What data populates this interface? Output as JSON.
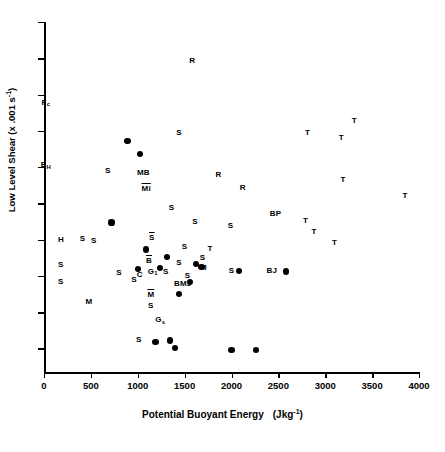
{
  "chart": {
    "type": "scatter",
    "title": "",
    "xlabel_main": "Potential Buoyant Energy",
    "xlabel_units": "(Jkg-1)",
    "ylabel": "Low Level Shear (x .001 s-1)"
  },
  "axes": {
    "x_ticks": [
      "0",
      "500",
      "1000",
      "1500",
      "2000",
      "2500",
      "3000",
      "3500",
      "4000"
    ],
    "x_tick_values": [
      0,
      500,
      1000,
      1500,
      2000,
      2500,
      3000,
      3500,
      4000
    ],
    "y_ticks": [
      "1",
      "2",
      "3",
      "4",
      "5",
      "6",
      "7",
      "8",
      "9",
      "10"
    ],
    "y_tick_values": [
      1,
      2,
      3,
      4,
      5,
      6,
      7,
      8,
      9,
      10
    ],
    "xlim": [
      0,
      4000
    ],
    "ylim": [
      0.35,
      10
    ],
    "grid": false,
    "legend": "none"
  },
  "chart_data": {
    "type": "scatter",
    "title": "",
    "xlabel": "Potential Buoyant Energy   (Jkg-1)",
    "ylabel": "Low Level Shear (x .001 s-1)",
    "xlim": [
      0,
      4000
    ],
    "ylim": [
      0.35,
      10
    ],
    "grid": false,
    "legend": "none",
    "marker_points": [
      {
        "x": 890,
        "y": 6.72
      },
      {
        "x": 1020,
        "y": 6.35
      },
      {
        "x": 720,
        "y": 4.47
      },
      {
        "x": 1090,
        "y": 3.73
      },
      {
        "x": 1310,
        "y": 3.53
      },
      {
        "x": 1240,
        "y": 3.22
      },
      {
        "x": 1620,
        "y": 3.33
      },
      {
        "x": 1680,
        "y": 3.25
      },
      {
        "x": 1560,
        "y": 2.83
      },
      {
        "x": 1440,
        "y": 2.5
      },
      {
        "x": 1000,
        "y": 3.18
      },
      {
        "x": 2080,
        "y": 3.13
      },
      {
        "x": 2580,
        "y": 3.12
      },
      {
        "x": 1190,
        "y": 1.18
      },
      {
        "x": 1400,
        "y": 1.02
      },
      {
        "x": 1340,
        "y": 1.22
      },
      {
        "x": 2000,
        "y": 0.96
      },
      {
        "x": 2260,
        "y": 0.96
      }
    ],
    "text_points": [
      {
        "label": "R",
        "x": 1580,
        "y": 8.93,
        "style": "plain"
      },
      {
        "label": "Fc",
        "x": 20,
        "y": 7.78,
        "style": "sub"
      },
      {
        "label": "T",
        "x": 3310,
        "y": 7.28,
        "style": "plain"
      },
      {
        "label": "T",
        "x": 2810,
        "y": 6.95,
        "style": "plain"
      },
      {
        "label": "T",
        "x": 3170,
        "y": 6.8,
        "style": "plain"
      },
      {
        "label": "S",
        "x": 1440,
        "y": 6.93,
        "style": "plain"
      },
      {
        "label": "EH",
        "x": 20,
        "y": 6.05,
        "style": "sub"
      },
      {
        "label": "S",
        "x": 680,
        "y": 5.9,
        "style": "plain"
      },
      {
        "label": "MB",
        "x": 1060,
        "y": 5.85,
        "style": "plain"
      },
      {
        "label": "R",
        "x": 1860,
        "y": 5.78,
        "style": "plain"
      },
      {
        "label": "T",
        "x": 3190,
        "y": 5.65,
        "style": "plain"
      },
      {
        "label": "Mi",
        "x": 1090,
        "y": 5.4,
        "style": "overline"
      },
      {
        "label": "R",
        "x": 2120,
        "y": 5.43,
        "style": "plain"
      },
      {
        "label": "T",
        "x": 3850,
        "y": 5.2,
        "style": "plain"
      },
      {
        "label": "S",
        "x": 1360,
        "y": 4.88,
        "style": "plain"
      },
      {
        "label": "BP",
        "x": 2470,
        "y": 4.72,
        "style": "plain"
      },
      {
        "label": "T",
        "x": 2790,
        "y": 4.5,
        "style": "plain"
      },
      {
        "label": "S",
        "x": 1610,
        "y": 4.48,
        "style": "plain"
      },
      {
        "label": "S",
        "x": 1990,
        "y": 4.38,
        "style": "plain"
      },
      {
        "label": "H",
        "x": 180,
        "y": 4.0,
        "style": "plain"
      },
      {
        "label": "S",
        "x": 410,
        "y": 4.03,
        "style": "plain"
      },
      {
        "label": "S",
        "x": 530,
        "y": 3.95,
        "style": "plain"
      },
      {
        "label": "S",
        "x": 1150,
        "y": 4.05,
        "style": "overline"
      },
      {
        "label": "S",
        "x": 1500,
        "y": 3.8,
        "style": "plain"
      },
      {
        "label": "T",
        "x": 1770,
        "y": 3.75,
        "style": "plain"
      },
      {
        "label": "T",
        "x": 2880,
        "y": 4.22,
        "style": "plain"
      },
      {
        "label": "T",
        "x": 3100,
        "y": 3.92,
        "style": "plain"
      },
      {
        "label": "S",
        "x": 180,
        "y": 3.3,
        "style": "plain"
      },
      {
        "label": "B",
        "x": 1120,
        "y": 3.42,
        "style": "overline"
      },
      {
        "label": "S",
        "x": 1440,
        "y": 3.35,
        "style": "plain"
      },
      {
        "label": "S",
        "x": 1690,
        "y": 3.48,
        "style": "plain"
      },
      {
        "label": "M",
        "x": 1700,
        "y": 3.22,
        "style": "plain"
      },
      {
        "label": "S",
        "x": 2000,
        "y": 3.13,
        "style": "plain"
      },
      {
        "label": "BJ",
        "x": 2430,
        "y": 3.13,
        "style": "plain"
      },
      {
        "label": "S",
        "x": 180,
        "y": 2.82,
        "style": "plain"
      },
      {
        "label": "S",
        "x": 800,
        "y": 3.07,
        "style": "plain"
      },
      {
        "label": "C",
        "x": 1020,
        "y": 3.02,
        "style": "plain"
      },
      {
        "label": "G1",
        "x": 1160,
        "y": 3.12,
        "style": "sub"
      },
      {
        "label": "S",
        "x": 1300,
        "y": 3.12,
        "style": "plain"
      },
      {
        "label": "S",
        "x": 1530,
        "y": 3.0,
        "style": "plain"
      },
      {
        "label": "S",
        "x": 960,
        "y": 2.9,
        "style": "plain"
      },
      {
        "label": "BMJ",
        "x": 1480,
        "y": 2.78,
        "style": "plain"
      },
      {
        "label": "M",
        "x": 1140,
        "y": 2.48,
        "style": "overline"
      },
      {
        "label": "M",
        "x": 480,
        "y": 2.28,
        "style": "plain"
      },
      {
        "label": "S",
        "x": 1140,
        "y": 2.18,
        "style": "plain"
      },
      {
        "label": "Gs",
        "x": 1240,
        "y": 1.78,
        "style": "sub"
      },
      {
        "label": "S",
        "x": 1010,
        "y": 1.22,
        "style": "plain"
      }
    ]
  },
  "colors": {
    "ink": "#000000",
    "background": "#ffffff"
  }
}
